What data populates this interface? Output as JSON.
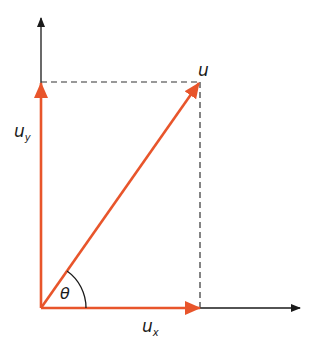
{
  "diagram": {
    "colors": {
      "vector": "#e8552b",
      "axis": "#1a1a1a",
      "dashed": "#333333",
      "background": "#ffffff"
    },
    "labels": {
      "u": "u",
      "uy_main": "u",
      "uy_sub": "y",
      "ux_main": "u",
      "ux_sub": "x",
      "theta": "θ"
    },
    "elements": [
      {
        "id": "x-axis",
        "type": "axis",
        "direction": "horizontal"
      },
      {
        "id": "y-axis",
        "type": "axis",
        "direction": "vertical"
      },
      {
        "id": "u",
        "type": "vector",
        "label": "u"
      },
      {
        "id": "u_x",
        "type": "component-vector",
        "label": "u_x"
      },
      {
        "id": "u_y",
        "type": "component-vector",
        "label": "u_y"
      },
      {
        "id": "theta",
        "type": "angle",
        "label": "θ",
        "between": [
          "u_x",
          "u"
        ]
      },
      {
        "id": "projection-horizontal",
        "type": "dashed-line"
      },
      {
        "id": "projection-vertical",
        "type": "dashed-line"
      }
    ]
  }
}
